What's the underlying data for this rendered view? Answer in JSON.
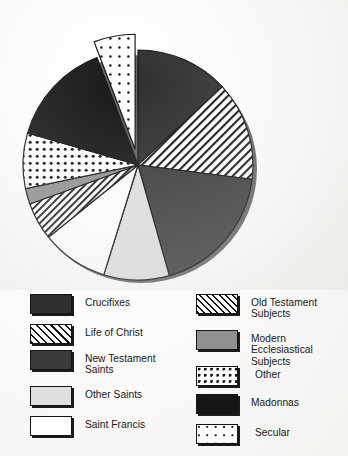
{
  "chart_data": {
    "type": "pie",
    "title": "",
    "subtitle": "",
    "xlabel": "",
    "ylabel": "",
    "grid": false,
    "legend_position": "bottom",
    "exploded_slices": [
      "Secular"
    ],
    "start_angle_deg": 0,
    "direction": "clockwise",
    "categories": [
      "Crucifixes",
      "Life of Christ",
      "New Testament Saints",
      "Other Saints",
      "Saint Francis",
      "Old Testament Subjects",
      "Modern Ecclesiastical Subjects",
      "Other",
      "Madonnas",
      "Secular"
    ],
    "values": [
      13.1,
      13.9,
      18.6,
      9.2,
      9.4,
      5.3,
      2.2,
      7.8,
      14.7,
      5.8
    ],
    "units": "percent",
    "slices": [
      {
        "label": "Crucifixes",
        "value": 13.1,
        "start_deg": 0.0,
        "end_deg": 47.2,
        "fill": "solid-dark",
        "color": "#302f2f",
        "exploded": false
      },
      {
        "label": "Life of Christ",
        "value": 13.9,
        "start_deg": 47.2,
        "end_deg": 97.2,
        "fill": "diagonal-hatch",
        "color": "#ffffff",
        "exploded": false
      },
      {
        "label": "New Testament Saints",
        "value": 18.6,
        "start_deg": 97.2,
        "end_deg": 164.2,
        "fill": "solid-gray",
        "color": "#3a3a3a",
        "exploded": false
      },
      {
        "label": "Other Saints",
        "value": 9.2,
        "start_deg": 164.2,
        "end_deg": 197.3,
        "fill": "solid-light",
        "color": "#dedede",
        "exploded": false
      },
      {
        "label": "Saint Francis",
        "value": 9.4,
        "start_deg": 197.3,
        "end_deg": 231.1,
        "fill": "solid-white",
        "color": "#ffffff",
        "exploded": false
      },
      {
        "label": "Old Testament Subjects",
        "value": 5.3,
        "start_deg": 231.1,
        "end_deg": 250.2,
        "fill": "fine-hatch",
        "color": "#ffffff",
        "exploded": false
      },
      {
        "label": "Modern Ecclesiastical Subjects",
        "value": 2.2,
        "start_deg": 250.2,
        "end_deg": 258.1,
        "fill": "solid-midgray",
        "color": "#8f8f8f",
        "exploded": false
      },
      {
        "label": "Other",
        "value": 7.8,
        "start_deg": 258.1,
        "end_deg": 286.2,
        "fill": "coarse-dots",
        "color": "#ffffff",
        "exploded": false
      },
      {
        "label": "Madonnas",
        "value": 14.7,
        "start_deg": 286.2,
        "end_deg": 339.1,
        "fill": "solid-black",
        "color": "#161616",
        "exploded": false
      },
      {
        "label": "Secular",
        "value": 5.8,
        "start_deg": 339.1,
        "end_deg": 360.0,
        "fill": "sparse-dots",
        "color": "#ffffff",
        "exploded": true
      }
    ],
    "geometry": {
      "center_x": 138,
      "center_y": 165,
      "radius": 115,
      "explode_offset": 16,
      "shadow": true
    }
  },
  "legend": {
    "columns": [
      {
        "items": [
          {
            "label": "Crucifixes",
            "swatch": "solid-dark",
            "color": "#302f2f"
          },
          {
            "label": "Life of Christ",
            "swatch": "diagonal-hatch",
            "color": "#ffffff"
          },
          {
            "label": "New Testament\nSaints",
            "swatch": "solid-gray",
            "color": "#3a3a3a"
          },
          {
            "label": "Other Saints",
            "swatch": "solid-light",
            "color": "#dedede"
          },
          {
            "label": "Saint Francis",
            "swatch": "solid-white",
            "color": "#ffffff"
          }
        ]
      },
      {
        "items": [
          {
            "label": "Old Testament\nSubjects",
            "swatch": "fine-hatch",
            "color": "#ffffff"
          },
          {
            "label": "Modern Ecclesiastical\nSubjects",
            "swatch": "solid-midgray",
            "color": "#8f8f8f"
          },
          {
            "label": "Other",
            "swatch": "coarse-dots",
            "color": "#ffffff"
          },
          {
            "label": "Madonnas",
            "swatch": "solid-black",
            "color": "#161616"
          },
          {
            "label": "Secular",
            "swatch": "sparse-dots",
            "color": "#ffffff"
          }
        ]
      }
    ]
  },
  "colors": {
    "background": "#fbfaf8",
    "ink": "#141414",
    "shadow": "#1b1b1b"
  }
}
